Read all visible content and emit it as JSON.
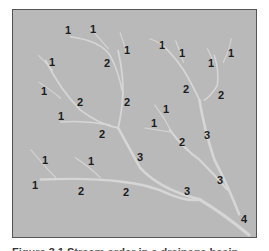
{
  "figure": {
    "type": "stream-order-diagram",
    "background_color": "#b9b9b9",
    "stream_color": "#d4d4d4",
    "label_color": "#1c1c1c",
    "labels": [
      {
        "text": "1",
        "x": 68,
        "y": 30
      },
      {
        "text": "1",
        "x": 93,
        "y": 29
      },
      {
        "text": "1",
        "x": 127,
        "y": 50
      },
      {
        "text": "1",
        "x": 162,
        "y": 45
      },
      {
        "text": "1",
        "x": 182,
        "y": 53
      },
      {
        "text": "1",
        "x": 211,
        "y": 63
      },
      {
        "text": "1",
        "x": 231,
        "y": 53
      },
      {
        "text": "1",
        "x": 52,
        "y": 62
      },
      {
        "text": "2",
        "x": 107,
        "y": 63
      },
      {
        "text": "1",
        "x": 44,
        "y": 91
      },
      {
        "text": "2",
        "x": 80,
        "y": 102
      },
      {
        "text": "2",
        "x": 127,
        "y": 102
      },
      {
        "text": "2",
        "x": 186,
        "y": 89
      },
      {
        "text": "2",
        "x": 221,
        "y": 95
      },
      {
        "text": "1",
        "x": 61,
        "y": 116
      },
      {
        "text": "1",
        "x": 166,
        "y": 109
      },
      {
        "text": "1",
        "x": 154,
        "y": 123
      },
      {
        "text": "2",
        "x": 102,
        "y": 134
      },
      {
        "text": "3",
        "x": 207,
        "y": 135
      },
      {
        "text": "2",
        "x": 182,
        "y": 142
      },
      {
        "text": "3",
        "x": 140,
        "y": 157
      },
      {
        "text": "1",
        "x": 45,
        "y": 160
      },
      {
        "text": "1",
        "x": 91,
        "y": 161
      },
      {
        "text": "1",
        "x": 35,
        "y": 185
      },
      {
        "text": "2",
        "x": 81,
        "y": 191
      },
      {
        "text": "2",
        "x": 126,
        "y": 192
      },
      {
        "text": "3",
        "x": 187,
        "y": 191
      },
      {
        "text": "3",
        "x": 220,
        "y": 180
      },
      {
        "text": "4",
        "x": 244,
        "y": 219
      }
    ]
  },
  "caption": {
    "text": "Figure 3.1  Stream order in a drainage basin"
  }
}
